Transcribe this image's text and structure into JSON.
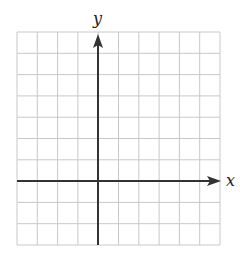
{
  "diagram": {
    "type": "coordinate-grid",
    "x_axis_label": "x",
    "y_axis_label": "y",
    "grid": {
      "columns": 10,
      "rows": 10,
      "y_axis_column_index": 4,
      "x_axis_row_index": 7
    },
    "colors": {
      "grid_line": "#c8c8c8",
      "axis": "#333333",
      "background": "#ffffff"
    }
  }
}
